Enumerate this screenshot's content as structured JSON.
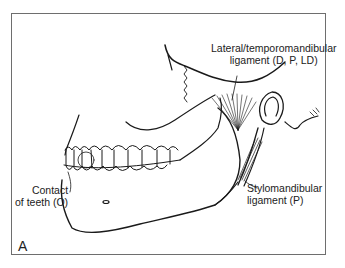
{
  "figure": {
    "panel_letter": "A",
    "labels": {
      "lateral_line1": "Lateral/temporomandibular",
      "lateral_line2": "ligament (D, P, LD)",
      "contact_line1": "Contact",
      "contact_line2": "of teeth (O)",
      "stylo_line1": "Stylomandibular",
      "stylo_line2": "ligament (P)"
    },
    "colors": {
      "stroke": "#1a1a1a",
      "frame": "#6e6e6e"
    }
  }
}
